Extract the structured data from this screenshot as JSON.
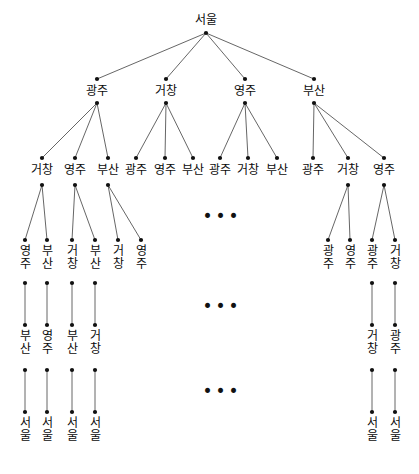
{
  "figure": {
    "name": "state-space-search-tree",
    "background_color": "#ffffff",
    "node_color": "#111111",
    "edge_color": "#555555",
    "text_color": "#0b0b0b"
  },
  "cities": {
    "seoul": "서울",
    "gwangju": "광주",
    "geochang": "거창",
    "yeongju": "영주",
    "busan": "부산"
  },
  "ellipsis": {
    "glyph": "•••",
    "marks": [
      {
        "id": "ellipsis-level3",
        "x": 222,
        "y": 216
      },
      {
        "id": "ellipsis-level4",
        "x": 222,
        "y": 306
      },
      {
        "id": "ellipsis-level5",
        "x": 222,
        "y": 391
      }
    ]
  },
  "nodes": [
    {
      "id": "n0",
      "label": "서울",
      "x": 206,
      "y": 33,
      "label_x": 206,
      "label_y": 14,
      "orient": "horizontal",
      "level": 0
    },
    {
      "id": "n1a",
      "label": "광주",
      "x": 97,
      "y": 79,
      "label_x": 97,
      "label_y": 85,
      "orient": "horizontal",
      "level": 1,
      "dot2_y": 103
    },
    {
      "id": "n1b",
      "label": "거창",
      "x": 166,
      "y": 79,
      "label_x": 166,
      "label_y": 85,
      "orient": "horizontal",
      "level": 1,
      "dot2_y": 103
    },
    {
      "id": "n1c",
      "label": "영주",
      "x": 245,
      "y": 79,
      "label_x": 245,
      "label_y": 85,
      "orient": "horizontal",
      "level": 1,
      "dot2_y": 103
    },
    {
      "id": "n1d",
      "label": "부산",
      "x": 314,
      "y": 79,
      "label_x": 314,
      "label_y": 85,
      "orient": "horizontal",
      "level": 1,
      "dot2_y": 103
    },
    {
      "id": "n2a1",
      "label": "거창",
      "x": 42,
      "y": 158,
      "label_x": 42,
      "label_y": 164,
      "orient": "horizontal",
      "level": 2,
      "dot2_y": 185
    },
    {
      "id": "n2a2",
      "label": "영주",
      "x": 75,
      "y": 158,
      "label_x": 75,
      "label_y": 164,
      "orient": "horizontal",
      "level": 2,
      "dot2_y": 185
    },
    {
      "id": "n2a3",
      "label": "부산",
      "x": 108,
      "y": 158,
      "label_x": 108,
      "label_y": 164,
      "orient": "horizontal",
      "level": 2,
      "dot2_y": 185
    },
    {
      "id": "n2b1",
      "label": "광주",
      "x": 136,
      "y": 158,
      "label_x": 136,
      "label_y": 164,
      "orient": "horizontal",
      "level": 2
    },
    {
      "id": "n2b2",
      "label": "영주",
      "x": 165,
      "y": 158,
      "label_x": 165,
      "label_y": 164,
      "orient": "horizontal",
      "level": 2
    },
    {
      "id": "n2b3",
      "label": "부산",
      "x": 193,
      "y": 158,
      "label_x": 193,
      "label_y": 164,
      "orient": "horizontal",
      "level": 2
    },
    {
      "id": "n2c1",
      "label": "광주",
      "x": 220,
      "y": 158,
      "label_x": 220,
      "label_y": 164,
      "orient": "horizontal",
      "level": 2
    },
    {
      "id": "n2c2",
      "label": "거창",
      "x": 248,
      "y": 158,
      "label_x": 248,
      "label_y": 164,
      "orient": "horizontal",
      "level": 2
    },
    {
      "id": "n2c3",
      "label": "부산",
      "x": 277,
      "y": 158,
      "label_x": 277,
      "label_y": 164,
      "orient": "horizontal",
      "level": 2
    },
    {
      "id": "n2d1",
      "label": "광주",
      "x": 313,
      "y": 158,
      "label_x": 313,
      "label_y": 164,
      "orient": "horizontal",
      "level": 2
    },
    {
      "id": "n2d2",
      "label": "거창",
      "x": 348,
      "y": 158,
      "label_x": 348,
      "label_y": 164,
      "orient": "horizontal",
      "level": 2,
      "dot2_y": 185
    },
    {
      "id": "n2d3",
      "label": "영주",
      "x": 384,
      "y": 158,
      "label_x": 384,
      "label_y": 164,
      "orient": "horizontal",
      "level": 2,
      "dot2_y": 185
    },
    {
      "id": "n3a1",
      "label": "영주",
      "x": 25,
      "y": 240,
      "label_x": 25,
      "label_y": 245,
      "orient": "vertical",
      "level": 3,
      "dot2_y": 283
    },
    {
      "id": "n3a2",
      "label": "부산",
      "x": 47,
      "y": 240,
      "label_x": 47,
      "label_y": 245,
      "orient": "vertical",
      "level": 3,
      "dot2_y": 283
    },
    {
      "id": "n3b1",
      "label": "거창",
      "x": 72,
      "y": 240,
      "label_x": 72,
      "label_y": 245,
      "orient": "vertical",
      "level": 3,
      "dot2_y": 283
    },
    {
      "id": "n3b2",
      "label": "부산",
      "x": 95,
      "y": 240,
      "label_x": 95,
      "label_y": 245,
      "orient": "vertical",
      "level": 3,
      "dot2_y": 283
    },
    {
      "id": "n3c1",
      "label": "거창",
      "x": 118,
      "y": 240,
      "label_x": 118,
      "label_y": 245,
      "orient": "vertical",
      "level": 3
    },
    {
      "id": "n3c2",
      "label": "영주",
      "x": 141,
      "y": 240,
      "label_x": 141,
      "label_y": 245,
      "orient": "vertical",
      "level": 3
    },
    {
      "id": "n3d1",
      "label": "광주",
      "x": 328,
      "y": 240,
      "label_x": 328,
      "label_y": 245,
      "orient": "vertical",
      "level": 3
    },
    {
      "id": "n3d2",
      "label": "영주",
      "x": 350,
      "y": 240,
      "label_x": 350,
      "label_y": 245,
      "orient": "vertical",
      "level": 3
    },
    {
      "id": "n3e1",
      "label": "광주",
      "x": 372,
      "y": 240,
      "label_x": 372,
      "label_y": 245,
      "orient": "vertical",
      "level": 3,
      "dot2_y": 283
    },
    {
      "id": "n3e2",
      "label": "거창",
      "x": 395,
      "y": 240,
      "label_x": 395,
      "label_y": 245,
      "orient": "vertical",
      "level": 3,
      "dot2_y": 283
    },
    {
      "id": "n4a",
      "label": "부산",
      "x": 25,
      "y": 325,
      "label_x": 25,
      "label_y": 330,
      "orient": "vertical",
      "level": 4,
      "dot2_y": 370
    },
    {
      "id": "n4b",
      "label": "영주",
      "x": 47,
      "y": 325,
      "label_x": 47,
      "label_y": 330,
      "orient": "vertical",
      "level": 4,
      "dot2_y": 370
    },
    {
      "id": "n4c",
      "label": "부산",
      "x": 72,
      "y": 325,
      "label_x": 72,
      "label_y": 330,
      "orient": "vertical",
      "level": 4,
      "dot2_y": 370
    },
    {
      "id": "n4d",
      "label": "거창",
      "x": 95,
      "y": 325,
      "label_x": 95,
      "label_y": 330,
      "orient": "vertical",
      "level": 4,
      "dot2_y": 370
    },
    {
      "id": "n4e",
      "label": "거창",
      "x": 372,
      "y": 325,
      "label_x": 372,
      "label_y": 330,
      "orient": "vertical",
      "level": 4,
      "dot2_y": 370
    },
    {
      "id": "n4f",
      "label": "광주",
      "x": 395,
      "y": 325,
      "label_x": 395,
      "label_y": 330,
      "orient": "vertical",
      "level": 4,
      "dot2_y": 370
    },
    {
      "id": "n5a",
      "label": "서울",
      "x": 25,
      "y": 412,
      "label_x": 25,
      "label_y": 417,
      "orient": "vertical",
      "level": 5
    },
    {
      "id": "n5b",
      "label": "서울",
      "x": 47,
      "y": 412,
      "label_x": 47,
      "label_y": 417,
      "orient": "vertical",
      "level": 5
    },
    {
      "id": "n5c",
      "label": "서울",
      "x": 72,
      "y": 412,
      "label_x": 72,
      "label_y": 417,
      "orient": "vertical",
      "level": 5
    },
    {
      "id": "n5d",
      "label": "서울",
      "x": 95,
      "y": 412,
      "label_x": 95,
      "label_y": 417,
      "orient": "vertical",
      "level": 5
    },
    {
      "id": "n5e",
      "label": "서울",
      "x": 372,
      "y": 412,
      "label_x": 372,
      "label_y": 417,
      "orient": "vertical",
      "level": 5
    },
    {
      "id": "n5f",
      "label": "서울",
      "x": 395,
      "y": 412,
      "label_x": 395,
      "label_y": 417,
      "orient": "vertical",
      "level": 5
    }
  ],
  "edges": [
    {
      "from": [
        206,
        33
      ],
      "to": [
        97,
        79
      ]
    },
    {
      "from": [
        206,
        33
      ],
      "to": [
        166,
        79
      ]
    },
    {
      "from": [
        206,
        33
      ],
      "to": [
        245,
        79
      ]
    },
    {
      "from": [
        206,
        33
      ],
      "to": [
        314,
        79
      ]
    },
    {
      "from": [
        97,
        103
      ],
      "to": [
        42,
        158
      ]
    },
    {
      "from": [
        97,
        103
      ],
      "to": [
        75,
        158
      ]
    },
    {
      "from": [
        97,
        103
      ],
      "to": [
        108,
        158
      ]
    },
    {
      "from": [
        166,
        103
      ],
      "to": [
        136,
        158
      ]
    },
    {
      "from": [
        166,
        103
      ],
      "to": [
        165,
        158
      ]
    },
    {
      "from": [
        166,
        103
      ],
      "to": [
        193,
        158
      ]
    },
    {
      "from": [
        245,
        103
      ],
      "to": [
        220,
        158
      ]
    },
    {
      "from": [
        245,
        103
      ],
      "to": [
        248,
        158
      ]
    },
    {
      "from": [
        245,
        103
      ],
      "to": [
        277,
        158
      ]
    },
    {
      "from": [
        314,
        103
      ],
      "to": [
        313,
        158
      ]
    },
    {
      "from": [
        314,
        103
      ],
      "to": [
        348,
        158
      ]
    },
    {
      "from": [
        314,
        103
      ],
      "to": [
        384,
        158
      ]
    },
    {
      "from": [
        42,
        185
      ],
      "to": [
        25,
        240
      ]
    },
    {
      "from": [
        42,
        185
      ],
      "to": [
        47,
        240
      ]
    },
    {
      "from": [
        75,
        185
      ],
      "to": [
        72,
        240
      ]
    },
    {
      "from": [
        75,
        185
      ],
      "to": [
        95,
        240
      ]
    },
    {
      "from": [
        108,
        185
      ],
      "to": [
        118,
        240
      ]
    },
    {
      "from": [
        108,
        185
      ],
      "to": [
        141,
        240
      ]
    },
    {
      "from": [
        348,
        185
      ],
      "to": [
        328,
        240
      ]
    },
    {
      "from": [
        348,
        185
      ],
      "to": [
        350,
        240
      ]
    },
    {
      "from": [
        384,
        185
      ],
      "to": [
        372,
        240
      ]
    },
    {
      "from": [
        384,
        185
      ],
      "to": [
        395,
        240
      ]
    },
    {
      "from": [
        25,
        283
      ],
      "to": [
        25,
        325
      ]
    },
    {
      "from": [
        47,
        283
      ],
      "to": [
        47,
        325
      ]
    },
    {
      "from": [
        72,
        283
      ],
      "to": [
        72,
        325
      ]
    },
    {
      "from": [
        95,
        283
      ],
      "to": [
        95,
        325
      ]
    },
    {
      "from": [
        372,
        283
      ],
      "to": [
        372,
        325
      ]
    },
    {
      "from": [
        395,
        283
      ],
      "to": [
        395,
        325
      ]
    },
    {
      "from": [
        25,
        370
      ],
      "to": [
        25,
        412
      ]
    },
    {
      "from": [
        47,
        370
      ],
      "to": [
        47,
        412
      ]
    },
    {
      "from": [
        72,
        370
      ],
      "to": [
        72,
        412
      ]
    },
    {
      "from": [
        95,
        370
      ],
      "to": [
        95,
        412
      ]
    },
    {
      "from": [
        372,
        370
      ],
      "to": [
        372,
        412
      ]
    },
    {
      "from": [
        395,
        370
      ],
      "to": [
        395,
        412
      ]
    }
  ]
}
